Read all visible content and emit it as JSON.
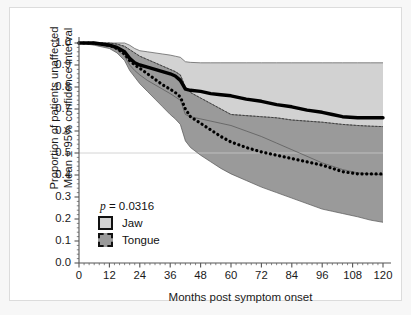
{
  "figure": {
    "title": "",
    "pvalue_label": "p",
    "pvalue_eq": " = ",
    "pvalue": "0.0316"
  },
  "axes": {
    "ylabel_line1": "Proportion of patients unaffected",
    "ylabel_line2": "Mean ± 95% confidence interval",
    "xlabel": "Months post symptom onset",
    "yticks": [
      "0.0",
      "0.1",
      "0.2",
      "0.3",
      "0.4",
      "0.5",
      "0.6",
      "0.7",
      "0.8",
      "0.9",
      "1.0"
    ],
    "xticks": [
      "0",
      "12",
      "24",
      "36",
      "48",
      "60",
      "72",
      "84",
      "96",
      "108",
      "120"
    ]
  },
  "legend": {
    "items": [
      {
        "label": "Jaw",
        "color": "#d2d2d2",
        "border": "solid"
      },
      {
        "label": "Tongue",
        "color": "#9a9a9a",
        "border": "dashed"
      }
    ]
  },
  "colors": {
    "jaw_band": "#d2d2d2",
    "tongue_band": "#9a9a9a",
    "mean_line": "#000000",
    "ci_edge": "#555555",
    "gridline": "#c9c9c9",
    "axis": "#555555",
    "text": "#1a1a1a"
  },
  "chart_data": {
    "type": "line",
    "title": "",
    "xlabel": "Months post symptom onset",
    "ylabel": "Proportion of patients unaffected Mean ± 95% confidence interval",
    "xlim": [
      0,
      120
    ],
    "ylim": [
      0.0,
      1.0
    ],
    "xticks": [
      0,
      12,
      24,
      36,
      48,
      60,
      72,
      84,
      96,
      108,
      120
    ],
    "yticks": [
      0.0,
      0.1,
      0.2,
      0.3,
      0.4,
      0.5,
      0.6,
      0.7,
      0.8,
      0.9,
      1.0
    ],
    "grid": "horizontal line at y=0.5 only",
    "legend_position": "lower-left inside axes",
    "annotations": [
      {
        "text": "p = 0.0316",
        "x": 8,
        "y": 0.3
      }
    ],
    "x": [
      0,
      6,
      12,
      15,
      18,
      20,
      22,
      24,
      27,
      30,
      33,
      36,
      38,
      40,
      42,
      44,
      48,
      52,
      56,
      60,
      66,
      72,
      78,
      84,
      90,
      96,
      100,
      104,
      110,
      115,
      120
    ],
    "series": [
      {
        "name": "Jaw",
        "style": "solid-thick",
        "mean": [
          1.0,
          1.0,
          0.99,
          0.98,
          0.96,
          0.93,
          0.91,
          0.9,
          0.89,
          0.88,
          0.87,
          0.86,
          0.85,
          0.83,
          0.79,
          0.785,
          0.78,
          0.77,
          0.765,
          0.76,
          0.745,
          0.735,
          0.72,
          0.71,
          0.695,
          0.685,
          0.675,
          0.665,
          0.66,
          0.66,
          0.66
        ],
        "ci_upper": [
          1.0,
          1.0,
          1.0,
          1.0,
          1.0,
          0.99,
          0.975,
          0.965,
          0.96,
          0.955,
          0.95,
          0.945,
          0.94,
          0.935,
          0.915,
          0.912,
          0.91,
          0.91,
          0.91,
          0.91,
          0.91,
          0.91,
          0.91,
          0.91,
          0.91,
          0.91,
          0.91,
          0.91,
          0.91,
          0.91,
          0.91
        ],
        "ci_lower": [
          1.0,
          0.995,
          0.985,
          0.97,
          0.94,
          0.9,
          0.875,
          0.855,
          0.83,
          0.81,
          0.79,
          0.77,
          0.755,
          0.74,
          0.675,
          0.665,
          0.655,
          0.645,
          0.635,
          0.625,
          0.6,
          0.575,
          0.545,
          0.515,
          0.485,
          0.455,
          0.44,
          0.425,
          0.41,
          0.405,
          0.4
        ]
      },
      {
        "name": "Tongue",
        "style": "dotted-thick",
        "mean": [
          1.0,
          1.0,
          0.99,
          0.975,
          0.95,
          0.92,
          0.9,
          0.885,
          0.86,
          0.835,
          0.81,
          0.79,
          0.775,
          0.755,
          0.7,
          0.665,
          0.635,
          0.605,
          0.575,
          0.55,
          0.525,
          0.505,
          0.49,
          0.475,
          0.46,
          0.445,
          0.43,
          0.415,
          0.405,
          0.405,
          0.405
        ],
        "ci_upper": [
          1.0,
          1.0,
          1.0,
          0.995,
          0.985,
          0.97,
          0.955,
          0.94,
          0.925,
          0.91,
          0.895,
          0.88,
          0.87,
          0.855,
          0.8,
          0.775,
          0.75,
          0.725,
          0.7,
          0.675,
          0.67,
          0.665,
          0.66,
          0.65,
          0.645,
          0.64,
          0.635,
          0.63,
          0.625,
          0.622,
          0.62
        ],
        "ci_lower": [
          1.0,
          0.99,
          0.975,
          0.955,
          0.92,
          0.875,
          0.845,
          0.815,
          0.78,
          0.745,
          0.71,
          0.675,
          0.655,
          0.63,
          0.555,
          0.525,
          0.49,
          0.46,
          0.43,
          0.405,
          0.375,
          0.345,
          0.32,
          0.295,
          0.27,
          0.245,
          0.235,
          0.225,
          0.21,
          0.195,
          0.185
        ]
      }
    ]
  }
}
